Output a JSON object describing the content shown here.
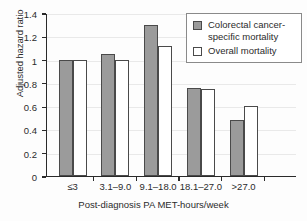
{
  "chart_data": {
    "type": "bar",
    "title": "",
    "subtitle": "",
    "xlabel": "Post-diagnosis PA MET-hours/week",
    "ylabel": "Adjusted hazard ratio",
    "categories": [
      "≤3",
      "3.1–9.0",
      "9.1–18.0",
      "18.1–27.0",
      ">27.0"
    ],
    "series": [
      {
        "name": "Colorectal cancer-specific mortality",
        "values": [
          1.0,
          1.05,
          1.3,
          0.76,
          0.48
        ],
        "color": "#9b9b9b",
        "style": "filled"
      },
      {
        "name": "Overall mortality",
        "values": [
          1.0,
          1.0,
          1.12,
          0.75,
          0.6
        ],
        "color": "#ffffff",
        "style": "open"
      }
    ],
    "ylim": [
      0,
      1.4
    ],
    "yticks": [
      0,
      0.2,
      0.4,
      0.6,
      0.8,
      1.0,
      1.2,
      1.4
    ],
    "ytick_labels": [
      "0",
      "0.2",
      "0.4",
      "0.6",
      "0.8",
      "1",
      "1.2",
      "1.4"
    ],
    "grid": true,
    "legend_position": "top-right"
  },
  "legend": {
    "entries": [
      {
        "label": "Colorectal cancer-specific mortality",
        "swatch": "filled-gray-square"
      },
      {
        "label": "Overall mortality",
        "swatch": "open-white-square"
      }
    ]
  }
}
